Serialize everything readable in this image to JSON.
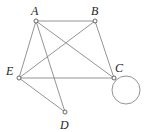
{
  "diagram": {
    "type": "graph",
    "stroke_color": "#888888",
    "node_fill": "#ffffff",
    "nodes": [
      {
        "id": "A",
        "label": "A",
        "x": 36,
        "y": 21,
        "lx": 31,
        "ly": 15
      },
      {
        "id": "B",
        "label": "B",
        "x": 95,
        "y": 21,
        "lx": 91,
        "ly": 15
      },
      {
        "id": "C",
        "label": "C",
        "x": 114,
        "y": 78,
        "lx": 115,
        "ly": 72
      },
      {
        "id": "D",
        "label": "D",
        "x": 65,
        "y": 112,
        "lx": 60,
        "ly": 129
      },
      {
        "id": "E",
        "label": "E",
        "x": 19,
        "y": 78,
        "lx": 6,
        "ly": 75
      }
    ],
    "edges": [
      [
        "A",
        "B"
      ],
      [
        "A",
        "E"
      ],
      [
        "A",
        "C"
      ],
      [
        "A",
        "D"
      ],
      [
        "B",
        "E"
      ],
      [
        "B",
        "C"
      ],
      [
        "E",
        "C"
      ],
      [
        "E",
        "D"
      ]
    ],
    "loops": [
      {
        "node": "C",
        "cx": 126,
        "cy": 90,
        "r": 14
      }
    ]
  }
}
